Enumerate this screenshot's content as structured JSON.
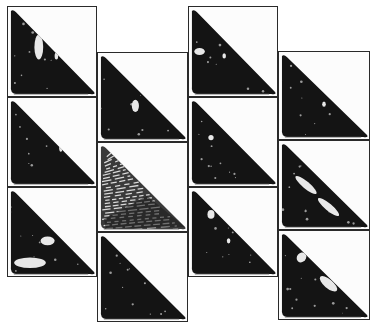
{
  "figure": {
    "columns": [
      {
        "x": 7,
        "y": 6,
        "w": 90,
        "cells": [
          {
            "id": "c1r1",
            "h": 91,
            "texture": "dark",
            "highlights": [
              [
                0.35,
                0.45,
                0.05,
                0.14
              ],
              [
                0.55,
                0.55,
                0.02,
                0.04
              ]
            ]
          },
          {
            "id": "c1r2",
            "h": 90,
            "texture": "dark",
            "highlights": [
              [
                0.6,
                0.55,
                0.02,
                0.06
              ]
            ]
          },
          {
            "id": "c1r3",
            "h": 90,
            "texture": "dark-speckled-base",
            "highlights": [
              [
                0.25,
                0.85,
                0.18,
                0.06
              ],
              [
                0.45,
                0.6,
                0.08,
                0.05
              ]
            ]
          }
        ]
      },
      {
        "x": 97,
        "y": 52,
        "w": 91,
        "cells": [
          {
            "id": "c2r1",
            "h": 90,
            "texture": "dark",
            "highlights": [
              [
                0.42,
                0.6,
                0.04,
                0.07
              ]
            ]
          },
          {
            "id": "c2r2",
            "h": 90,
            "texture": "striated-light",
            "highlights": []
          },
          {
            "id": "c2r3",
            "h": 90,
            "texture": "dark",
            "highlights": []
          }
        ]
      },
      {
        "x": 188,
        "y": 6,
        "w": 90,
        "cells": [
          {
            "id": "c3r1",
            "h": 91,
            "texture": "dark",
            "highlights": [
              [
                0.12,
                0.5,
                0.06,
                0.04
              ],
              [
                0.4,
                0.55,
                0.02,
                0.03
              ]
            ]
          },
          {
            "id": "c3r2",
            "h": 90,
            "texture": "dark",
            "highlights": [
              [
                0.25,
                0.45,
                0.03,
                0.03
              ]
            ]
          },
          {
            "id": "c3r3",
            "h": 90,
            "texture": "dark",
            "highlights": [
              [
                0.25,
                0.3,
                0.04,
                0.05
              ],
              [
                0.45,
                0.6,
                0.02,
                0.03
              ]
            ]
          }
        ]
      },
      {
        "x": 278,
        "y": 51,
        "w": 92,
        "cells": [
          {
            "id": "c4r1",
            "h": 89,
            "texture": "dark",
            "highlights": [
              [
                0.5,
                0.6,
                0.02,
                0.03
              ]
            ]
          },
          {
            "id": "c4r2",
            "h": 90,
            "texture": "dark-streaked",
            "highlights": [
              [
                0.3,
                0.5,
                0.15,
                0.04
              ],
              [
                0.55,
                0.75,
                0.15,
                0.04
              ]
            ]
          },
          {
            "id": "c4r3",
            "h": 90,
            "texture": "dark-streaked",
            "highlights": [
              [
                0.25,
                0.3,
                0.05,
                0.06
              ],
              [
                0.55,
                0.6,
                0.12,
                0.05
              ]
            ]
          }
        ]
      }
    ],
    "colors": {
      "frame": "#2a2a2a",
      "specimen": "#141414",
      "background": "#ffffff",
      "highlight": "#e8e8e8"
    }
  }
}
